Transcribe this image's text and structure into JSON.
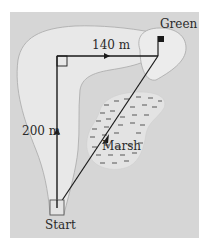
{
  "diagram": {
    "type": "golf-course-path-diagram",
    "labels": {
      "green": "Green",
      "horizontal_distance": "140 m",
      "vertical_distance": "200 m",
      "marsh": "Marsh",
      "start": "Start"
    },
    "segments": [
      {
        "name": "vertical-leg",
        "from": "Start",
        "to": "corner",
        "length": "200 m"
      },
      {
        "name": "horizontal-leg",
        "from": "corner",
        "to": "Green",
        "length": "140 m"
      },
      {
        "name": "diagonal-shortcut",
        "from": "Start",
        "to": "Green",
        "crosses": "Marsh"
      }
    ],
    "colors": {
      "background": "#d6d6d6",
      "fairway": "#e8e8e8",
      "green_area": "#ececec",
      "marsh": "#e3e3e3",
      "lines": "#1a1a1a",
      "outline": "#a8a8a8"
    }
  }
}
